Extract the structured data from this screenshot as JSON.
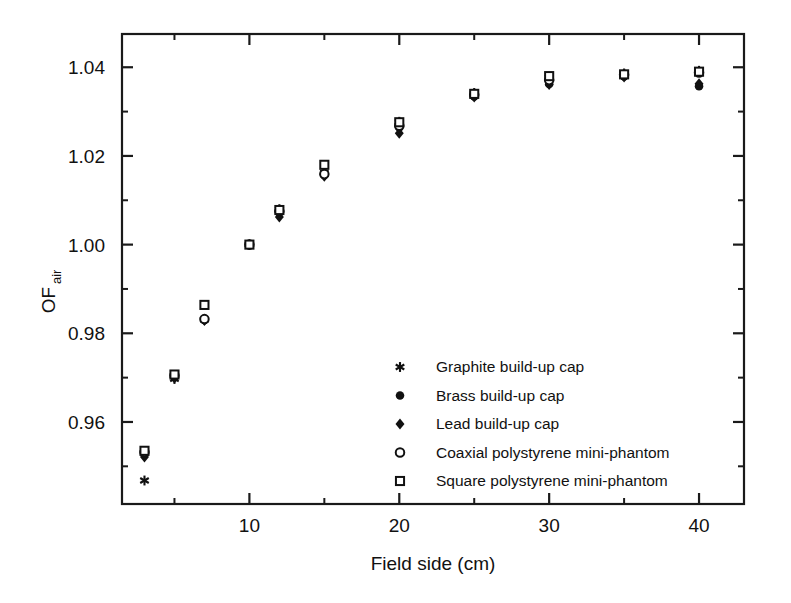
{
  "chart_data": {
    "type": "scatter",
    "title": "",
    "xlabel": "Field side (cm)",
    "ylabel": "OF",
    "ylabel_subscript": "air",
    "xlim": [
      1.5,
      43
    ],
    "ylim": [
      0.9415,
      1.0475
    ],
    "grid": false,
    "legend_position": "center-right-inside",
    "x_ticks_major": [
      10,
      20,
      30,
      40
    ],
    "x_ticks_minor": [
      5,
      15,
      25,
      35
    ],
    "x_tick_labels": [
      "10",
      "20",
      "30",
      "40"
    ],
    "y_ticks_major": [
      0.96,
      0.98,
      1.0,
      1.02,
      1.04
    ],
    "y_ticks_minor": [
      0.95,
      0.97,
      0.99,
      1.01,
      1.03
    ],
    "y_tick_labels": [
      "0.96",
      "0.98",
      "1.00",
      "1.02",
      "1.04"
    ],
    "x": [
      3,
      5,
      7,
      10,
      12,
      15,
      20,
      25,
      30,
      35,
      40
    ],
    "series": [
      {
        "name": "Graphite build-up cap",
        "marker": "asterisk",
        "filled": true,
        "values": [
          0.9468,
          0.9697,
          0.9831,
          1.0,
          1.008,
          1.0162,
          1.0277,
          1.0342,
          1.0377,
          1.0386,
          1.0392
        ]
      },
      {
        "name": "Brass build-up cap",
        "marker": "circle",
        "filled": true,
        "values": [
          0.9528,
          0.9701,
          0.983,
          1.0,
          1.0073,
          1.0157,
          1.0264,
          1.0334,
          1.0362,
          1.0379,
          1.0357
        ]
      },
      {
        "name": "Lead build-up cap",
        "marker": "diamond",
        "filled": true,
        "values": [
          0.9521,
          0.9699,
          0.9829,
          1.0,
          1.0062,
          1.0154,
          1.0251,
          1.0333,
          1.0361,
          1.0378,
          1.0363
        ]
      },
      {
        "name": "Coaxial polystyrene mini-phantom",
        "marker": "circle",
        "filled": false,
        "values": [
          0.9532,
          0.9705,
          0.9832,
          1.0,
          1.0075,
          1.0159,
          1.0268,
          1.0338,
          1.0371,
          1.0383,
          1.0388
        ]
      },
      {
        "name": "Square polystyrene mini-phantom",
        "marker": "square",
        "filled": false,
        "values": [
          0.9535,
          0.9707,
          0.9864,
          1.0,
          1.0078,
          1.018,
          1.0276,
          1.034,
          1.038,
          1.0384,
          1.039
        ]
      }
    ]
  },
  "legend": {
    "entries": [
      {
        "label": "Graphite build-up cap",
        "marker": "asterisk"
      },
      {
        "label": "Brass build-up cap",
        "marker": "filled-circle"
      },
      {
        "label": "Lead build-up cap",
        "marker": "filled-diamond"
      },
      {
        "label": "Coaxial polystyrene mini-phantom",
        "marker": "open-circle"
      },
      {
        "label": "Square polystyrene mini-phantom",
        "marker": "open-square"
      }
    ]
  },
  "colors": {
    "ink": "#111111",
    "background": "#ffffff"
  }
}
